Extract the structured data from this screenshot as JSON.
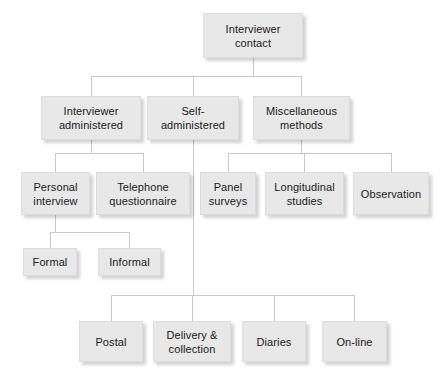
{
  "diagram": {
    "node_fill": "#e8e8e8",
    "node_border": "#dcdcdc",
    "connector_color": "#c9c9c9",
    "text_color": "#1a1a1a",
    "nodes": [
      {
        "id": "interviewer-contact",
        "label": "Interviewer\ncontact",
        "x": 203,
        "y": 13,
        "w": 100,
        "h": 45,
        "level": 0
      },
      {
        "id": "interviewer-administered",
        "label": "Interviewer\nadministered",
        "x": 41,
        "y": 96,
        "w": 100,
        "h": 44,
        "level": 1
      },
      {
        "id": "self-administered",
        "label": "Self-\nadministered",
        "x": 147,
        "y": 96,
        "w": 92,
        "h": 44,
        "level": 1
      },
      {
        "id": "miscellaneous-methods",
        "label": "Miscellaneous\nmethods",
        "x": 253,
        "y": 96,
        "w": 97,
        "h": 44,
        "level": 1
      },
      {
        "id": "personal-interview",
        "label": "Personal\ninterview",
        "x": 21,
        "y": 172,
        "w": 69,
        "h": 43,
        "level": 2
      },
      {
        "id": "telephone-questionnaire",
        "label": "Telephone\nquestionnaire",
        "x": 96,
        "y": 172,
        "w": 94,
        "h": 43,
        "level": 2
      },
      {
        "id": "panel-surveys",
        "label": "Panel\nsurveys",
        "x": 200,
        "y": 172,
        "w": 56,
        "h": 43,
        "level": 2
      },
      {
        "id": "longitudinal-studies",
        "label": "Longitudinal\nstudies",
        "x": 265,
        "y": 172,
        "w": 79,
        "h": 43,
        "level": 2
      },
      {
        "id": "observation",
        "label": "Observation",
        "x": 353,
        "y": 172,
        "w": 76,
        "h": 43,
        "level": 2
      },
      {
        "id": "formal",
        "label": "Formal",
        "x": 23,
        "y": 248,
        "w": 54,
        "h": 28,
        "level": 3
      },
      {
        "id": "informal",
        "label": "Informal",
        "x": 98,
        "y": 248,
        "w": 63,
        "h": 28,
        "level": 3
      },
      {
        "id": "postal",
        "label": "Postal",
        "x": 79,
        "y": 321,
        "w": 64,
        "h": 41,
        "level": 3
      },
      {
        "id": "delivery-and-collection",
        "label": "Delivery &\ncollection",
        "x": 153,
        "y": 321,
        "w": 78,
        "h": 41,
        "level": 3
      },
      {
        "id": "diaries",
        "label": "Diaries",
        "x": 242,
        "y": 321,
        "w": 64,
        "h": 41,
        "level": 3
      },
      {
        "id": "on-line",
        "label": "On-line",
        "x": 322,
        "y": 321,
        "w": 65,
        "h": 41,
        "level": 3
      }
    ],
    "edges": [
      {
        "from": "interviewer-contact",
        "to": "interviewer-administered"
      },
      {
        "from": "interviewer-contact",
        "to": "self-administered"
      },
      {
        "from": "interviewer-contact",
        "to": "miscellaneous-methods"
      },
      {
        "from": "interviewer-administered",
        "to": "personal-interview"
      },
      {
        "from": "interviewer-administered",
        "to": "telephone-questionnaire"
      },
      {
        "from": "miscellaneous-methods",
        "to": "panel-surveys"
      },
      {
        "from": "miscellaneous-methods",
        "to": "longitudinal-studies"
      },
      {
        "from": "miscellaneous-methods",
        "to": "observation"
      },
      {
        "from": "personal-interview",
        "to": "formal"
      },
      {
        "from": "personal-interview",
        "to": "informal"
      },
      {
        "from": "self-administered",
        "to": "postal"
      },
      {
        "from": "self-administered",
        "to": "delivery-and-collection"
      },
      {
        "from": "self-administered",
        "to": "diaries"
      },
      {
        "from": "self-administered",
        "to": "on-line"
      }
    ],
    "buses": [
      {
        "id": "bus-root",
        "y": 76,
        "x1": 91,
        "x2": 301,
        "parent_x": 253,
        "parent_y": 58,
        "children_x": [
          91,
          193,
          301
        ],
        "children_y": 96
      },
      {
        "id": "bus-interviewer-admin",
        "y": 153,
        "x1": 55,
        "x2": 143,
        "parent_x": 91,
        "parent_y": 140,
        "children_x": [
          55,
          143
        ],
        "children_y": 172
      },
      {
        "id": "bus-miscellaneous",
        "y": 153,
        "x1": 228,
        "x2": 391,
        "parent_x": 301,
        "parent_y": 140,
        "children_x": [
          228,
          304,
          391
        ],
        "children_y": 172
      },
      {
        "id": "bus-personal-interview",
        "y": 232,
        "x1": 50,
        "x2": 129,
        "parent_x": 55,
        "parent_y": 215,
        "children_x": [
          50,
          129
        ],
        "children_y": 248
      },
      {
        "id": "bus-self-admin",
        "y": 295,
        "x1": 111,
        "x2": 354,
        "parent_x": 193,
        "parent_y": 140,
        "children_x": [
          111,
          192,
          274,
          354
        ],
        "children_y": 321
      }
    ]
  }
}
